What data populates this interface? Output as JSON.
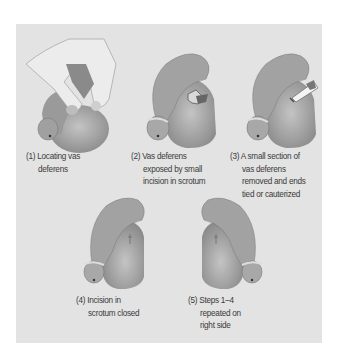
{
  "figure": {
    "colors": {
      "background": "#e3e3e3",
      "tissue_dark": "#7f7f7f",
      "tissue_mid": "#9c9c9c",
      "tissue_light": "#c4c4c4",
      "glove": "#e8e8e8",
      "text": "#3a3a3a"
    },
    "steps": [
      {
        "number": "(1)",
        "lines": [
          "Locating vas",
          "deferens"
        ],
        "icon": "hand-locating-vas-deferens-icon"
      },
      {
        "number": "(2)",
        "lines": [
          "Vas deferens",
          "exposed by small",
          "incision in scrotum"
        ],
        "icon": "incision-exposed-icon"
      },
      {
        "number": "(3)",
        "lines": [
          "A small section of",
          "vas deferens",
          "removed and ends",
          "tied or cauterized"
        ],
        "icon": "cautery-tool-icon"
      },
      {
        "number": "(4)",
        "lines": [
          "Incision in",
          "scrotum closed"
        ],
        "icon": "closed-incision-icon"
      },
      {
        "number": "(5)",
        "lines": [
          "Steps 1–4",
          "repeated on",
          "right side"
        ],
        "icon": "right-side-closed-icon"
      }
    ]
  }
}
